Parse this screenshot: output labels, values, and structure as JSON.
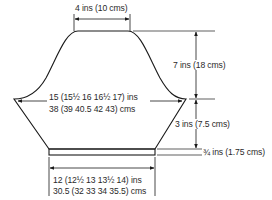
{
  "diagram": {
    "type": "knitting-pattern-schematic",
    "colors": {
      "line": "#1a1a1a",
      "text": "#2a2a2a",
      "background": "#ffffff"
    },
    "labels": {
      "top_width": "4 ins (10 cms)",
      "upper_height": "7 ins (18 cms)",
      "chest_width_ins": "15 (15½ 16 16½ 17) ins",
      "chest_width_cms": "38 (39 40.5 42 43) cms",
      "lower_height": "3 ins (7.5 cms)",
      "band_height": "¾ ins (1.75 cms)",
      "bottom_width_ins": "12 (12½ 13 13½ 14) ins",
      "bottom_width_cms": "30.5 (32 33 34 35.5) cms"
    }
  }
}
